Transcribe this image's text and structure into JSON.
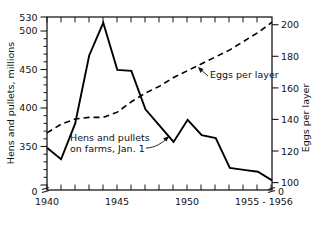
{
  "chart_data": {
    "type": "line",
    "title": "",
    "subtitle": "",
    "xlabel": "",
    "ylabel": "Hens and pullets, millions",
    "y2label": "Eggs per layer",
    "grid": false,
    "legend_position": "inline-annotations",
    "xlim": [
      1940,
      1956
    ],
    "ylim": [
      350,
      530
    ],
    "y2lim": [
      100,
      200
    ],
    "x_tick_labels": [
      "1940",
      "1945",
      "1950",
      "1955 - 1956"
    ],
    "x_tick_label_values": [
      1940,
      1945,
      1950,
      1955.5
    ],
    "x_minor_ticks": [
      1940,
      1941,
      1942,
      1943,
      1944,
      1945,
      1946,
      1947,
      1948,
      1949,
      1950,
      1951,
      1952,
      1953,
      1954,
      1955,
      1956
    ],
    "y_left_ticks": [
      350,
      400,
      450,
      500,
      530
    ],
    "y_left_tick_labels": [
      "350",
      "400",
      "450",
      "500",
      "530"
    ],
    "y_left_minor_ticks": [
      360,
      370,
      380,
      390,
      410,
      420,
      430,
      440,
      460,
      470,
      480,
      490,
      510,
      520
    ],
    "y_left_origin_label": "0",
    "y_right_ticks": [
      100,
      120,
      140,
      160,
      180,
      200
    ],
    "y_right_tick_labels": [
      "100",
      "120",
      "140",
      "160",
      "180",
      "200"
    ],
    "y_right_origin_label": "0",
    "axis_break": true,
    "x": [
      1940,
      1941,
      1942,
      1943,
      1944,
      1945,
      1946,
      1947,
      1948,
      1949,
      1950,
      1951,
      1952,
      1953,
      1954,
      1955,
      1956
    ],
    "series": [
      {
        "name": "Hens and pullets on farms, Jan. 1",
        "axis": "left",
        "style": "solid",
        "units": "millions",
        "values": [
          394,
          382,
          419,
          490,
          524,
          475,
          474,
          434,
          417,
          400,
          423,
          407,
          404,
          373,
          371,
          369,
          360
        ]
      },
      {
        "name": "Eggs per layer",
        "axis": "right",
        "style": "dashed",
        "units": "eggs",
        "values": [
          133,
          138,
          141,
          142,
          142,
          145,
          151,
          156,
          160,
          165,
          169,
          173,
          177,
          181,
          186,
          191,
          197
        ]
      }
    ],
    "annotations": [
      {
        "text_line_1": "Hens and pullets",
        "text_line_2": "on farms, Jan. 1",
        "target_series": "Hens and pullets on farms, Jan. 1",
        "target_x": 1949,
        "target_y": 400
      },
      {
        "text_line_1": "Eggs per layer",
        "text_line_2": "",
        "target_series": "Eggs per layer",
        "target_x": 1951,
        "target_y": 173
      }
    ]
  },
  "labels": {
    "y_left_title": "Hens and pullets, millions",
    "y_right_title": "Eggs per layer",
    "y_left_350": "350",
    "y_left_400": "400",
    "y_left_450": "450",
    "y_left_500": "500",
    "y_left_530": "530",
    "y_left_zero": "0",
    "y_right_100": "100",
    "y_right_120": "120",
    "y_right_140": "140",
    "y_right_160": "160",
    "y_right_180": "180",
    "y_right_200": "200",
    "y_right_zero": "0",
    "x_1940": "1940",
    "x_1945": "1945",
    "x_1950": "1950",
    "x_1955_1956": "1955 - 1956",
    "annot_hens_line1": "Hens and pullets",
    "annot_hens_line2": "on farms, Jan. 1",
    "annot_eggs": "Eggs per layer"
  },
  "colors": {
    "ink": "#111111",
    "line": "#000000",
    "background": "#ffffff"
  }
}
